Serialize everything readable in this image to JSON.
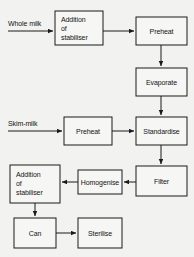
{
  "diagram": {
    "type": "flowchart",
    "background_color": "#f2f2f0",
    "line_color": "#1a1a1a",
    "box_fill_color": "#f6f6f4",
    "inputs": [
      {
        "id": "whole-milk",
        "label": "Whole milk"
      },
      {
        "id": "skim-milk",
        "label": "Skim-milk"
      }
    ],
    "nodes": [
      {
        "id": "addition-of-stabiliser-top",
        "lines": [
          "Addition",
          "of",
          "stabiliser"
        ],
        "align": "left"
      },
      {
        "id": "preheat-top",
        "lines": [
          "Preheat"
        ],
        "align": "center"
      },
      {
        "id": "evaporate",
        "lines": [
          "Evaporate"
        ],
        "align": "center"
      },
      {
        "id": "preheat-bottom",
        "lines": [
          "Preheat"
        ],
        "align": "center"
      },
      {
        "id": "standardise",
        "lines": [
          "Standardise"
        ],
        "align": "center"
      },
      {
        "id": "filter",
        "lines": [
          "Filter"
        ],
        "align": "center"
      },
      {
        "id": "homogenise",
        "lines": [
          "Homogenise"
        ],
        "align": "center"
      },
      {
        "id": "addition-of-stabiliser-bottom",
        "lines": [
          "Addition",
          "of",
          "stabiliser"
        ],
        "align": "left"
      },
      {
        "id": "can",
        "lines": [
          "Can"
        ],
        "align": "center"
      },
      {
        "id": "sterilise",
        "lines": [
          "Sterilise"
        ],
        "align": "center"
      }
    ],
    "edges": [
      {
        "from": "whole-milk",
        "to": "addition-of-stabiliser-top"
      },
      {
        "from": "addition-of-stabiliser-top",
        "to": "preheat-top"
      },
      {
        "from": "preheat-top",
        "to": "evaporate"
      },
      {
        "from": "evaporate",
        "to": "standardise"
      },
      {
        "from": "skim-milk",
        "to": "preheat-bottom"
      },
      {
        "from": "preheat-bottom",
        "to": "standardise"
      },
      {
        "from": "standardise",
        "to": "filter"
      },
      {
        "from": "filter",
        "to": "homogenise"
      },
      {
        "from": "homogenise",
        "to": "addition-of-stabiliser-bottom"
      },
      {
        "from": "addition-of-stabiliser-bottom",
        "to": "can"
      },
      {
        "from": "can",
        "to": "sterilise"
      }
    ]
  }
}
